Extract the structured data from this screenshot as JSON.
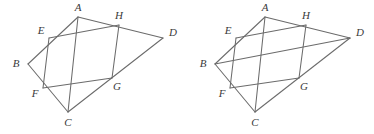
{
  "figure_set": {
    "title": "Quadrilateral ABCD with inscribed midpoint parallelogram EFGH",
    "background_color": "#ffffff",
    "stroke_color": "#6b6b6b",
    "label_color": "#3a3a3a",
    "panel_count": 2,
    "panels": [
      {
        "id": "figure-left",
        "name": "left-figure",
        "caption": "",
        "vertices": [
          {
            "key": "A",
            "label": "A",
            "x": 78,
            "y": 17,
            "label_x": 78,
            "label_y": 8
          },
          {
            "key": "B",
            "label": "B",
            "x": 28,
            "y": 64,
            "label_x": 16,
            "label_y": 64
          },
          {
            "key": "C",
            "label": "C",
            "x": 68,
            "y": 112,
            "label_x": 68,
            "label_y": 123
          },
          {
            "key": "D",
            "label": "D",
            "x": 163,
            "y": 38,
            "label_x": 173,
            "label_y": 33
          },
          {
            "key": "E",
            "label": "E",
            "x": 49,
            "y": 38,
            "label_x": 41,
            "label_y": 31
          },
          {
            "key": "F",
            "label": "F",
            "x": 43,
            "y": 88,
            "label_x": 35,
            "label_y": 94
          },
          {
            "key": "G",
            "label": "G",
            "x": 112,
            "y": 78,
            "label_x": 117,
            "label_y": 87
          },
          {
            "key": "H",
            "label": "H",
            "x": 119,
            "y": 25,
            "label_x": 119,
            "label_y": 16
          }
        ],
        "segments": [
          {
            "name": "segment-AB",
            "from": "A",
            "to": "B"
          },
          {
            "name": "segment-BC",
            "from": "B",
            "to": "C"
          },
          {
            "name": "segment-CD",
            "from": "C",
            "to": "D"
          },
          {
            "name": "segment-AD",
            "from": "A",
            "to": "D"
          },
          {
            "name": "segment-EF",
            "from": "E",
            "to": "F"
          },
          {
            "name": "segment-FG",
            "from": "F",
            "to": "G"
          },
          {
            "name": "segment-GH",
            "from": "G",
            "to": "H"
          },
          {
            "name": "segment-EH",
            "from": "E",
            "to": "H"
          },
          {
            "name": "diagonal-AC",
            "from": "A",
            "to": "C"
          }
        ]
      },
      {
        "id": "figure-right",
        "name": "right-figure",
        "caption": "",
        "vertices": [
          {
            "key": "A",
            "label": "A",
            "x": 78,
            "y": 17,
            "label_x": 78,
            "label_y": 8
          },
          {
            "key": "B",
            "label": "B",
            "x": 28,
            "y": 64,
            "label_x": 16,
            "label_y": 64
          },
          {
            "key": "C",
            "label": "C",
            "x": 68,
            "y": 112,
            "label_x": 68,
            "label_y": 123
          },
          {
            "key": "D",
            "label": "D",
            "x": 163,
            "y": 38,
            "label_x": 173,
            "label_y": 33
          },
          {
            "key": "E",
            "label": "E",
            "x": 49,
            "y": 38,
            "label_x": 41,
            "label_y": 31
          },
          {
            "key": "F",
            "label": "F",
            "x": 43,
            "y": 88,
            "label_x": 35,
            "label_y": 94
          },
          {
            "key": "G",
            "label": "G",
            "x": 112,
            "y": 78,
            "label_x": 117,
            "label_y": 87
          },
          {
            "key": "H",
            "label": "H",
            "x": 119,
            "y": 25,
            "label_x": 119,
            "label_y": 16
          }
        ],
        "segments": [
          {
            "name": "segment-AB",
            "from": "A",
            "to": "B"
          },
          {
            "name": "segment-BC",
            "from": "B",
            "to": "C"
          },
          {
            "name": "segment-CD",
            "from": "C",
            "to": "D"
          },
          {
            "name": "segment-AD",
            "from": "A",
            "to": "D"
          },
          {
            "name": "segment-EF",
            "from": "E",
            "to": "F"
          },
          {
            "name": "segment-FG",
            "from": "F",
            "to": "G"
          },
          {
            "name": "segment-GH",
            "from": "G",
            "to": "H"
          },
          {
            "name": "segment-EH",
            "from": "E",
            "to": "H"
          },
          {
            "name": "diagonal-AC",
            "from": "A",
            "to": "C"
          },
          {
            "name": "diagonal-BD",
            "from": "B",
            "to": "D"
          }
        ]
      }
    ]
  }
}
